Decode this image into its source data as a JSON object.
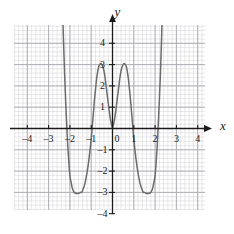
{
  "figure": {
    "background": "#ffffff",
    "grid_minor_color": "#d8d8dc",
    "grid_major_color": "#a8a8ae",
    "axis_color": "#1a1a1a",
    "curve_color": "#6b6b6b",
    "x_axis_label": "x",
    "y_axis_label": "y"
  },
  "chart_data": {
    "type": "line",
    "title": "",
    "xlabel": "x",
    "ylabel": "y",
    "xlim": [
      -4.9,
      4.9
    ],
    "ylim": [
      -4.8,
      5.0
    ],
    "grid": true,
    "minor_ticks_per_unit": 5,
    "legend": "none",
    "x_ticks": [
      -4,
      -3,
      -2,
      -1,
      0,
      1,
      2,
      3,
      4
    ],
    "x_tick_labels": [
      "–4",
      "–3",
      "–2",
      "–1",
      "0",
      "1",
      "2",
      "3",
      "4"
    ],
    "y_ticks": [
      -4,
      -3,
      -2,
      -1,
      1,
      2,
      3,
      4
    ],
    "y_tick_labels": [
      "–4",
      "–3",
      "–2",
      "–1",
      "1",
      "2",
      "3",
      "4"
    ],
    "series": [
      {
        "name": "curve-left",
        "description": "quartic with local maximum near (-1, 3) and local minimum near (-1.45, -3), passing through the origin",
        "points": [
          [
            -2.44,
            9.2
          ],
          [
            -2.4,
            7.6
          ],
          [
            -2.35,
            5.8
          ],
          [
            -2.3,
            4.1
          ],
          [
            -2.25,
            2.6
          ],
          [
            -2.2,
            1.3
          ],
          [
            -2.15,
            0.2
          ],
          [
            -2.1,
            -0.8
          ],
          [
            -2.05,
            -1.6
          ],
          [
            -2.0,
            -2.2
          ],
          [
            -1.95,
            -2.5
          ],
          [
            -1.9,
            -2.75
          ],
          [
            -1.85,
            -2.9
          ],
          [
            -1.8,
            -3.0
          ],
          [
            -1.7,
            -3.05
          ],
          [
            -1.6,
            -3.05
          ],
          [
            -1.5,
            -3.0
          ],
          [
            -1.45,
            -3.0
          ],
          [
            -1.4,
            -2.9
          ],
          [
            -1.3,
            -2.6
          ],
          [
            -1.2,
            -2.1
          ],
          [
            -1.1,
            -1.4
          ],
          [
            -1.0,
            -0.5
          ],
          [
            -0.95,
            0.1
          ],
          [
            -0.9,
            0.7
          ],
          [
            -0.85,
            1.3
          ],
          [
            -0.8,
            1.8
          ],
          [
            -0.75,
            2.3
          ],
          [
            -0.7,
            2.65
          ],
          [
            -0.65,
            2.9
          ],
          [
            -0.6,
            3.0
          ],
          [
            -0.55,
            3.05
          ],
          [
            -0.5,
            3.0
          ],
          [
            -0.45,
            2.9
          ],
          [
            -0.4,
            2.7
          ],
          [
            -0.35,
            2.4
          ],
          [
            -0.3,
            2.0
          ],
          [
            -0.25,
            1.6
          ],
          [
            -0.2,
            1.2
          ],
          [
            -0.15,
            0.8
          ],
          [
            -0.1,
            0.45
          ],
          [
            -0.05,
            0.2
          ],
          [
            0.0,
            0.0
          ]
        ]
      },
      {
        "name": "curve-right",
        "description": "mirror image of curve-left reflected across the y-axis; local maximum near (1, 3), local minimum near (1.45, -3), passing through the origin",
        "points": [
          [
            2.44,
            9.2
          ],
          [
            2.4,
            7.6
          ],
          [
            2.35,
            5.8
          ],
          [
            2.3,
            4.1
          ],
          [
            2.25,
            2.6
          ],
          [
            2.2,
            1.3
          ],
          [
            2.15,
            0.2
          ],
          [
            2.1,
            -0.8
          ],
          [
            2.05,
            -1.6
          ],
          [
            2.0,
            -2.2
          ],
          [
            1.95,
            -2.5
          ],
          [
            1.9,
            -2.75
          ],
          [
            1.85,
            -2.9
          ],
          [
            1.8,
            -3.0
          ],
          [
            1.7,
            -3.05
          ],
          [
            1.6,
            -3.05
          ],
          [
            1.5,
            -3.0
          ],
          [
            1.45,
            -3.0
          ],
          [
            1.4,
            -2.9
          ],
          [
            1.3,
            -2.6
          ],
          [
            1.2,
            -2.1
          ],
          [
            1.1,
            -1.4
          ],
          [
            1.0,
            -0.5
          ],
          [
            0.95,
            0.1
          ],
          [
            0.9,
            0.7
          ],
          [
            0.85,
            1.3
          ],
          [
            0.8,
            1.8
          ],
          [
            0.75,
            2.3
          ],
          [
            0.7,
            2.65
          ],
          [
            0.65,
            2.9
          ],
          [
            0.6,
            3.0
          ],
          [
            0.55,
            3.05
          ],
          [
            0.5,
            3.0
          ],
          [
            0.45,
            2.9
          ],
          [
            0.4,
            2.7
          ],
          [
            0.35,
            2.4
          ],
          [
            0.3,
            2.0
          ],
          [
            0.25,
            1.6
          ],
          [
            0.2,
            1.2
          ],
          [
            0.15,
            0.8
          ],
          [
            0.1,
            0.45
          ],
          [
            0.05,
            0.2
          ],
          [
            0.0,
            0.0
          ]
        ]
      }
    ]
  }
}
